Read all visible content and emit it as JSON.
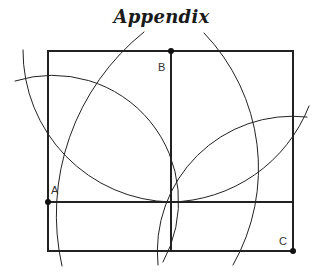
{
  "title": "Appendix",
  "colors": {
    "stroke": "#222222",
    "background": "#ffffff"
  },
  "points": {
    "A": {
      "label": "A",
      "x": 48,
      "y": 202
    },
    "B": {
      "label": "B",
      "x": 171,
      "y": 51
    },
    "C": {
      "label": "C",
      "x": 293,
      "y": 251
    }
  },
  "rectangle": {
    "x1": 48,
    "y1": 51,
    "x2": 293,
    "y2": 251
  },
  "lines": [
    {
      "name": "vertical-divider",
      "x1": 171,
      "y1": 51,
      "x2": 171,
      "y2": 251
    },
    {
      "name": "horizontal-divider",
      "x1": 48,
      "y1": 202,
      "x2": 293,
      "y2": 202
    }
  ],
  "arcs": [
    {
      "name": "arc-center-A-through-B",
      "cx": 48,
      "cy": 202,
      "r": 195
    },
    {
      "name": "arc-center-C-through-B",
      "cx": 293,
      "cy": 251,
      "r": 234
    },
    {
      "name": "arc-center-B-left",
      "cx": 171,
      "cy": 51,
      "r": 151
    },
    {
      "name": "arc-center-A-small",
      "cx": 48,
      "cy": 202,
      "r": 126
    },
    {
      "name": "arc-center-C-small",
      "cx": 293,
      "cy": 251,
      "r": 135
    }
  ]
}
